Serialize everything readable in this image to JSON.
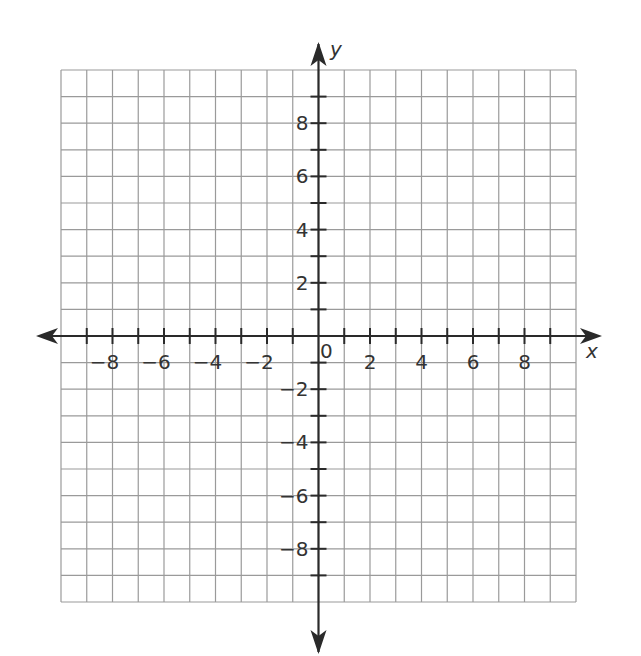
{
  "chart_data": {
    "type": "coordinate-grid",
    "title": "",
    "xlabel": "x",
    "ylabel": "y",
    "xlim": [
      -10,
      10
    ],
    "ylim": [
      -10,
      10
    ],
    "grid": true,
    "grid_step": 1,
    "label_step": 2,
    "x_tick_labels": [
      "−8",
      "−6",
      "−4",
      "−2",
      "2",
      "4",
      "6",
      "8"
    ],
    "x_tick_values": [
      -8,
      -6,
      -4,
      -2,
      2,
      4,
      6,
      8
    ],
    "y_tick_labels": [
      "8",
      "6",
      "4",
      "2",
      "−2",
      "−4",
      "−6",
      "−8"
    ],
    "y_tick_values": [
      8,
      6,
      4,
      2,
      -2,
      -4,
      -6,
      -8
    ],
    "origin_label": "0",
    "series": []
  },
  "colors": {
    "grid": "#9a9a9a",
    "axis": "#2a2a2a",
    "text": "#333333",
    "background": "#ffffff"
  }
}
